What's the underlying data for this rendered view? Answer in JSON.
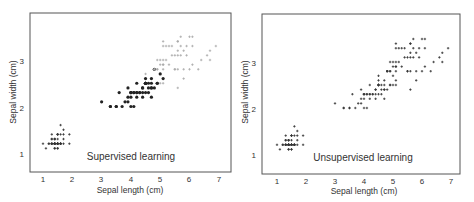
{
  "chart_data": [
    {
      "type": "scatter",
      "title": "Supervised learning",
      "xlabel": "Sepal length (cm)",
      "ylabel": "Sepal width (cm)",
      "xlim": [
        0.55,
        7.4
      ],
      "ylim": [
        0.6,
        3.9
      ],
      "xticks": [
        1,
        2,
        3,
        4,
        5,
        6,
        7
      ],
      "yticks": [
        1,
        2,
        3
      ],
      "grid": false,
      "legend": "none",
      "annotation": "Supervised learning",
      "series": [
        {
          "name": "class-1",
          "marker": "plus",
          "color": "#333333",
          "points": [
            [
              1.4,
              0.2
            ],
            [
              1.4,
              0.2
            ],
            [
              1.3,
              0.2
            ],
            [
              1.5,
              0.2
            ],
            [
              1.4,
              0.2
            ],
            [
              1.7,
              0.4
            ],
            [
              1.4,
              0.3
            ],
            [
              1.5,
              0.2
            ],
            [
              1.4,
              0.2
            ],
            [
              1.5,
              0.1
            ],
            [
              1.5,
              0.2
            ],
            [
              1.6,
              0.2
            ],
            [
              1.4,
              0.1
            ],
            [
              1.1,
              0.1
            ],
            [
              1.2,
              0.2
            ],
            [
              1.5,
              0.4
            ],
            [
              1.3,
              0.4
            ],
            [
              1.4,
              0.3
            ],
            [
              1.7,
              0.3
            ],
            [
              1.5,
              0.3
            ],
            [
              1.7,
              0.2
            ],
            [
              1.5,
              0.4
            ],
            [
              1.0,
              0.2
            ],
            [
              1.7,
              0.5
            ],
            [
              1.9,
              0.2
            ],
            [
              1.6,
              0.2
            ],
            [
              1.6,
              0.4
            ],
            [
              1.5,
              0.2
            ],
            [
              1.4,
              0.2
            ],
            [
              1.6,
              0.2
            ],
            [
              1.6,
              0.2
            ],
            [
              1.5,
              0.4
            ],
            [
              1.5,
              0.1
            ],
            [
              1.4,
              0.2
            ],
            [
              1.5,
              0.2
            ],
            [
              1.2,
              0.2
            ],
            [
              1.3,
              0.2
            ],
            [
              1.4,
              0.1
            ],
            [
              1.3,
              0.2
            ],
            [
              1.5,
              0.2
            ],
            [
              1.3,
              0.3
            ],
            [
              1.3,
              0.3
            ],
            [
              1.3,
              0.2
            ],
            [
              1.6,
              0.6
            ],
            [
              1.9,
              0.4
            ],
            [
              1.4,
              0.3
            ],
            [
              1.6,
              0.2
            ],
            [
              1.4,
              0.2
            ],
            [
              1.5,
              0.2
            ],
            [
              1.4,
              0.2
            ]
          ]
        },
        {
          "name": "class-2",
          "marker": "dot",
          "color": "#222222",
          "points": [
            [
              4.7,
              1.4
            ],
            [
              4.5,
              1.5
            ],
            [
              4.9,
              1.5
            ],
            [
              4.0,
              1.3
            ],
            [
              4.6,
              1.5
            ],
            [
              4.5,
              1.3
            ],
            [
              4.7,
              1.6
            ],
            [
              3.3,
              1.0
            ],
            [
              4.6,
              1.3
            ],
            [
              3.9,
              1.4
            ],
            [
              3.5,
              1.0
            ],
            [
              4.2,
              1.5
            ],
            [
              4.0,
              1.0
            ],
            [
              4.7,
              1.4
            ],
            [
              3.6,
              1.3
            ],
            [
              4.4,
              1.4
            ],
            [
              4.5,
              1.5
            ],
            [
              4.1,
              1.0
            ],
            [
              4.5,
              1.5
            ],
            [
              3.9,
              1.1
            ],
            [
              4.8,
              1.8
            ],
            [
              4.0,
              1.3
            ],
            [
              4.9,
              1.5
            ],
            [
              4.7,
              1.2
            ],
            [
              4.3,
              1.3
            ],
            [
              4.4,
              1.4
            ],
            [
              4.8,
              1.4
            ],
            [
              5.0,
              1.7
            ],
            [
              4.5,
              1.5
            ],
            [
              3.5,
              1.0
            ],
            [
              3.8,
              1.1
            ],
            [
              3.7,
              1.0
            ],
            [
              3.9,
              1.2
            ],
            [
              5.1,
              1.6
            ],
            [
              4.5,
              1.5
            ],
            [
              4.5,
              1.6
            ],
            [
              4.7,
              1.5
            ],
            [
              4.4,
              1.3
            ],
            [
              4.1,
              1.3
            ],
            [
              4.0,
              1.3
            ],
            [
              4.4,
              1.2
            ],
            [
              4.6,
              1.4
            ],
            [
              4.0,
              1.2
            ],
            [
              3.3,
              1.0
            ],
            [
              4.2,
              1.3
            ],
            [
              4.2,
              1.2
            ],
            [
              4.2,
              1.3
            ],
            [
              4.3,
              1.3
            ],
            [
              3.0,
              1.1
            ],
            [
              4.1,
              1.3
            ]
          ]
        },
        {
          "name": "class-3",
          "marker": "plus",
          "color": "#aaaaaa",
          "points": [
            [
              6.0,
              2.5
            ],
            [
              5.1,
              1.9
            ],
            [
              5.9,
              2.1
            ],
            [
              5.6,
              1.8
            ],
            [
              5.8,
              2.2
            ],
            [
              6.6,
              2.1
            ],
            [
              4.5,
              1.7
            ],
            [
              6.3,
              1.8
            ],
            [
              5.8,
              1.8
            ],
            [
              6.1,
              2.5
            ],
            [
              5.1,
              2.0
            ],
            [
              5.3,
              1.9
            ],
            [
              5.5,
              2.1
            ],
            [
              5.0,
              2.0
            ],
            [
              5.1,
              2.4
            ],
            [
              5.3,
              2.3
            ],
            [
              5.5,
              1.8
            ],
            [
              6.7,
              2.2
            ],
            [
              6.9,
              2.3
            ],
            [
              5.0,
              1.5
            ],
            [
              5.7,
              2.3
            ],
            [
              4.9,
              2.0
            ],
            [
              6.7,
              2.0
            ],
            [
              4.9,
              1.8
            ],
            [
              5.7,
              2.1
            ],
            [
              6.0,
              1.8
            ],
            [
              4.8,
              1.8
            ],
            [
              4.9,
              1.8
            ],
            [
              5.6,
              2.1
            ],
            [
              5.8,
              1.6
            ],
            [
              6.1,
              1.9
            ],
            [
              6.4,
              2.0
            ],
            [
              5.6,
              2.2
            ],
            [
              5.1,
              1.5
            ],
            [
              5.6,
              1.4
            ],
            [
              6.1,
              2.3
            ],
            [
              5.6,
              2.4
            ],
            [
              5.5,
              1.8
            ],
            [
              4.8,
              1.8
            ],
            [
              5.4,
              2.1
            ],
            [
              5.6,
              2.4
            ],
            [
              5.1,
              2.3
            ],
            [
              5.1,
              1.9
            ],
            [
              5.9,
              2.3
            ],
            [
              5.7,
              2.5
            ],
            [
              5.2,
              2.3
            ],
            [
              5.0,
              1.9
            ],
            [
              5.2,
              2.0
            ],
            [
              5.4,
              2.3
            ],
            [
              5.1,
              1.8
            ]
          ]
        }
      ]
    },
    {
      "type": "scatter",
      "title": "Unsupervised learning",
      "xlabel": "Sepal length (cm)",
      "ylabel": "Sepal width (cm)",
      "xlim": [
        0.55,
        7.4
      ],
      "ylim": [
        0.6,
        3.9
      ],
      "xticks": [
        1,
        2,
        3,
        4,
        5,
        6,
        7
      ],
      "yticks": [
        1,
        2,
        3
      ],
      "grid": false,
      "legend": "none",
      "annotation": "Unsupervised learning",
      "series": [
        {
          "name": "unlabeled",
          "marker": "plus",
          "color": "#333333",
          "points": "same 150 points as all three classes of the supervised panel, drawn with one unlabeled marker"
        }
      ]
    }
  ],
  "panels": [
    {
      "annotation": "Supervised learning",
      "xlabel": "Sepal length (cm)",
      "ylabel": "Sepal width (cm)",
      "xticks": [
        "1",
        "2",
        "3",
        "4",
        "5",
        "6",
        "7"
      ],
      "yticks": [
        "1",
        "2",
        "3"
      ]
    },
    {
      "annotation": "Unsupervised learning",
      "xlabel": "Sepal length (cm)",
      "ylabel": "Sepal width (cm)",
      "xticks": [
        "1",
        "2",
        "3",
        "4",
        "5",
        "6",
        "7"
      ],
      "yticks": [
        "1",
        "2",
        "3"
      ]
    }
  ]
}
